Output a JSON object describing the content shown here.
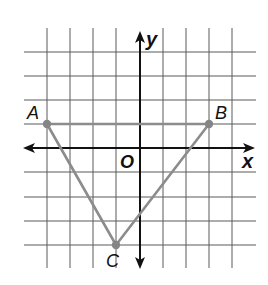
{
  "diagram": {
    "type": "coordinate-plane-triangle",
    "axes": {
      "x_label": "x",
      "y_label": "y",
      "origin_label": "O",
      "x_range": [
        -4,
        4
      ],
      "y_range": [
        -4,
        4
      ]
    },
    "grid": {
      "x_lines_px": [
        47,
        70,
        93,
        116,
        140,
        163,
        186,
        209,
        232
      ],
      "y_lines_px": [
        52,
        76,
        100,
        124,
        148,
        172,
        197,
        221,
        245
      ]
    },
    "points": [
      {
        "label": "A",
        "x": -4,
        "y": 1
      },
      {
        "label": "B",
        "x": 3,
        "y": 1
      },
      {
        "label": "C",
        "x": -1,
        "y": -4
      }
    ],
    "segments": [
      [
        "A",
        "B"
      ],
      [
        "B",
        "C"
      ],
      [
        "C",
        "A"
      ]
    ],
    "colors": {
      "grid": "#5a5a5a",
      "axes": "#111111",
      "triangle": "#8c8c8c",
      "points": "#858585"
    }
  }
}
